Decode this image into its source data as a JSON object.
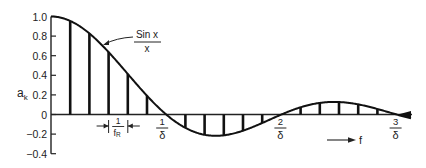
{
  "chart_data": {
    "type": "bar",
    "title": "",
    "xlabel": "f",
    "ylabel": "a_k",
    "ylim": [
      -0.4,
      1.0
    ],
    "yticks": [
      "1.0",
      "0.8",
      "0.6",
      "0.4",
      "0.2",
      "0",
      "-0.2",
      "-0.4"
    ],
    "grid": false,
    "legend": null,
    "curve_label": {
      "numerator": "Sin  x",
      "denominator": "x"
    },
    "spacing_label": {
      "numerator": "1",
      "denominator": "f",
      "subscript": "R"
    },
    "x_markers": [
      {
        "numerator": "1",
        "denominator": "δ"
      },
      {
        "numerator": "2",
        "denominator": "δ"
      },
      {
        "numerator": "3",
        "denominator": "δ"
      }
    ],
    "axis_arrow_label": "f",
    "series": [
      {
        "name": "a_k (sampled sin x / x)",
        "k": [
          1,
          2,
          3,
          4,
          5,
          6,
          7,
          8,
          9,
          10,
          11,
          12,
          13,
          14,
          15,
          16,
          17,
          18
        ],
        "values": [
          0.955,
          0.827,
          0.637,
          0.414,
          0.191,
          0.0,
          -0.136,
          -0.207,
          -0.212,
          -0.165,
          -0.087,
          0.0,
          0.073,
          0.118,
          0.127,
          0.103,
          0.056,
          0.0
        ]
      }
    ],
    "envelope": "sin(x)/x"
  }
}
